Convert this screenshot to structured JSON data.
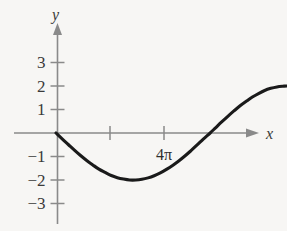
{
  "figure": {
    "background_color": "#f7f6f4",
    "axis_color": "#8a8a8a",
    "curve_color": "#1a1a1a",
    "text_color": "#3a3a3a",
    "y_axis_label": "y",
    "x_axis_label": "x"
  },
  "chart_data": {
    "type": "line",
    "title": "",
    "xlabel": "x",
    "ylabel": "y",
    "grid": false,
    "legend": null,
    "xlim": [
      0,
      9.8
    ],
    "ylim": [
      -3.6,
      3.4
    ],
    "y_ticks": [
      3,
      2,
      1,
      -1,
      -2,
      -3
    ],
    "y_tick_labels": [
      "3",
      "2",
      "1",
      "−1",
      "−2",
      "−3"
    ],
    "x_ticks": [
      2.2,
      4.4
    ],
    "x_tick_labels": [
      "",
      "4π"
    ],
    "annotations": [
      {
        "text": "4π",
        "x": 4.4,
        "y": -1.0
      }
    ],
    "series": [
      {
        "name": "y = -2 sin(x/2)",
        "amplitude": 2,
        "points": [
          [
            0.0,
            0.0
          ],
          [
            0.25,
            -0.25
          ],
          [
            0.5,
            -0.49
          ],
          [
            0.75,
            -0.73
          ],
          [
            1.0,
            -0.96
          ],
          [
            1.25,
            -1.17
          ],
          [
            1.5,
            -1.36
          ],
          [
            1.75,
            -1.54
          ],
          [
            2.0,
            -1.68
          ],
          [
            2.25,
            -1.81
          ],
          [
            2.5,
            -1.9
          ],
          [
            2.75,
            -1.96
          ],
          [
            3.0,
            -2.0
          ],
          [
            3.25,
            -2.0
          ],
          [
            3.5,
            -1.97
          ],
          [
            3.75,
            -1.91
          ],
          [
            4.0,
            -1.82
          ],
          [
            4.25,
            -1.7
          ],
          [
            4.5,
            -1.55
          ],
          [
            4.75,
            -1.38
          ],
          [
            5.0,
            -1.19
          ],
          [
            5.25,
            -0.98
          ],
          [
            5.5,
            -0.75
          ],
          [
            5.75,
            -0.51
          ],
          [
            6.0,
            -0.26
          ],
          [
            6.28,
            0.0
          ],
          [
            6.5,
            0.22
          ],
          [
            6.75,
            0.47
          ],
          [
            7.0,
            0.71
          ],
          [
            7.25,
            0.94
          ],
          [
            7.5,
            1.16
          ],
          [
            7.75,
            1.35
          ],
          [
            8.0,
            1.53
          ],
          [
            8.25,
            1.68
          ],
          [
            8.5,
            1.81
          ],
          [
            8.75,
            1.9
          ],
          [
            9.0,
            1.96
          ],
          [
            9.25,
            1.99
          ],
          [
            9.42,
            2.0
          ],
          [
            9.75,
            1.98
          ],
          [
            10.0,
            1.93
          ],
          [
            10.25,
            1.85
          ],
          [
            10.5,
            1.74
          ],
          [
            10.75,
            1.6
          ],
          [
            11.0,
            1.44
          ],
          [
            11.25,
            1.25
          ],
          [
            11.5,
            1.05
          ],
          [
            11.75,
            0.83
          ],
          [
            12.0,
            0.59
          ],
          [
            12.25,
            0.35
          ],
          [
            12.56,
            0.0
          ],
          [
            12.8,
            -0.24
          ],
          [
            13.05,
            -0.49
          ],
          [
            13.3,
            -0.73
          ],
          [
            13.55,
            -0.96
          ],
          [
            13.8,
            -1.18
          ],
          [
            14.0,
            -1.34
          ],
          [
            14.2,
            -1.49
          ],
          [
            14.4,
            -1.63
          ]
        ]
      }
    ]
  }
}
